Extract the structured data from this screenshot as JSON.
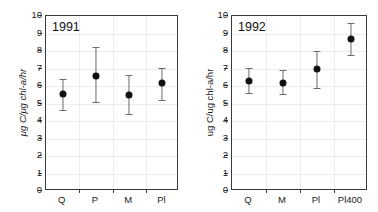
{
  "figure": {
    "background_color": "#ffffff",
    "axis_color": "#3a3a3a",
    "grid_color": "#ececec",
    "marker_color": "#111111",
    "errorbar_color": "#6b6b6b"
  },
  "chart_data": [
    {
      "type": "scatter",
      "panel": "left",
      "title": "1991",
      "xlabel": "",
      "ylabel": "μg C/μg chl-a/hr",
      "ylabel_italic": true,
      "ylim": [
        0,
        10
      ],
      "yticks": [
        0,
        1,
        2,
        3,
        4,
        5,
        6,
        7,
        8,
        9,
        10
      ],
      "ytick_labels": [
        "0",
        "1",
        "2",
        "3",
        "4",
        "5",
        "6",
        "7",
        "8",
        "9",
        "10"
      ],
      "grid": true,
      "legend": "none",
      "categories": [
        "Q",
        "P",
        "M",
        "Pl"
      ],
      "values": [
        5.55,
        6.6,
        5.5,
        6.15
      ],
      "error_low": [
        4.65,
        5.1,
        4.4,
        5.2
      ],
      "error_high": [
        6.4,
        8.25,
        6.65,
        7.05
      ]
    },
    {
      "type": "scatter",
      "panel": "right",
      "title": "1992",
      "xlabel": "",
      "ylabel": "ug C/ug chl-a/hr",
      "ylabel_italic": false,
      "ylim": [
        0,
        10
      ],
      "yticks": [
        0,
        1,
        2,
        3,
        4,
        5,
        6,
        7,
        8,
        9,
        10
      ],
      "ytick_labels": [
        "0",
        "1",
        "2",
        "3",
        "4",
        "5",
        "6",
        "7",
        "8",
        "9",
        "10"
      ],
      "grid": true,
      "legend": "none",
      "categories": [
        "Q",
        "M",
        "Pl",
        "Pl400"
      ],
      "values": [
        6.3,
        6.2,
        6.95,
        8.7
      ],
      "error_low": [
        5.6,
        5.55,
        5.9,
        7.8
      ],
      "error_high": [
        7.05,
        6.9,
        8.0,
        9.6
      ]
    }
  ]
}
